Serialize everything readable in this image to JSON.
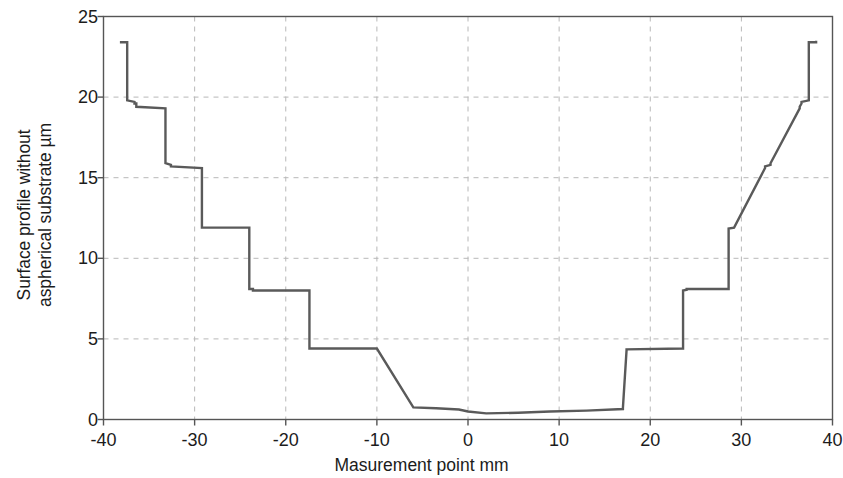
{
  "chart_data": {
    "type": "line",
    "title": "",
    "xlabel": "Masurement point mm",
    "ylabel_line1": "Surface profile without",
    "ylabel_line2": "aspherical substrate µm",
    "xlim": [
      -40,
      40
    ],
    "ylim": [
      0,
      25
    ],
    "xticks": [
      -40,
      -30,
      -20,
      -10,
      0,
      10,
      20,
      30,
      40
    ],
    "xticklabels": [
      "-40",
      "-30",
      "-20",
      "-10",
      "0",
      "10",
      "20",
      "30",
      "40"
    ],
    "yticks": [
      0,
      5,
      10,
      15,
      20,
      25
    ],
    "yticklabels": [
      "0",
      "5",
      "10",
      "15",
      "20",
      "25"
    ],
    "grid": true,
    "grid_style": "dashed",
    "grid_color": "#b8b8b8",
    "legend": null,
    "line_color": "#5a5a5a",
    "line_width": 2.4,
    "axes_color": "#555555",
    "background": "#ffffff",
    "series": [
      {
        "name": "Surface profile",
        "x": [
          -38.2,
          -38.2,
          -37.4,
          -37.4,
          -36.6,
          -36.6,
          -36.4,
          -36.4,
          -33.2,
          -33.2,
          -32.6,
          -32.6,
          -29.2,
          -29.2,
          -28.6,
          -28.6,
          -24.0,
          -24.0,
          -23.6,
          -23.6,
          -17.4,
          -17.4,
          -17.0,
          -17.0,
          -10.0,
          -6.0,
          -3.5,
          -1.0,
          0.0,
          2.0,
          5.5,
          9.0,
          13.0,
          17.0,
          17.0,
          17.4,
          17.4,
          23.6,
          23.6,
          24.0,
          24.0,
          28.6,
          28.6,
          29.2,
          29.2,
          32.6,
          32.6,
          33.2,
          33.2,
          36.4,
          36.4,
          36.6,
          36.6,
          37.4,
          37.4,
          38.2,
          38.2
        ],
        "y": [
          23.4,
          23.4,
          23.4,
          19.8,
          19.7,
          19.6,
          19.6,
          19.4,
          19.3,
          15.9,
          15.8,
          15.7,
          15.6,
          11.9,
          11.9,
          11.9,
          11.9,
          8.1,
          8.1,
          8.0,
          8.0,
          4.4,
          4.4,
          4.4,
          4.4,
          0.75,
          0.7,
          0.62,
          0.5,
          0.38,
          0.42,
          0.5,
          0.55,
          0.65,
          0.72,
          4.3,
          4.35,
          4.4,
          8.0,
          8.05,
          8.1,
          8.1,
          11.85,
          11.9,
          11.9,
          15.6,
          15.7,
          15.8,
          15.9,
          19.3,
          19.4,
          19.6,
          19.7,
          19.8,
          23.4,
          23.4,
          23.5
        ]
      }
    ],
    "plateaus": [
      {
        "zone": 1,
        "x_from": -38.2,
        "x_to": -37.4,
        "level": 23.4
      },
      {
        "zone": 2,
        "x_from": -37.2,
        "x_to": -33.4,
        "level": 19.65
      },
      {
        "zone": 3,
        "x_from": -33.0,
        "x_to": -29.2,
        "level": 15.75
      },
      {
        "zone": 4,
        "x_from": -28.8,
        "x_to": -24.0,
        "level": 11.9
      },
      {
        "zone": 5,
        "x_from": -23.6,
        "x_to": -17.4,
        "level": 8.05
      },
      {
        "zone": 6,
        "x_from": -17.0,
        "x_to": 17.0,
        "level": 0.55
      },
      {
        "zone": 7,
        "x_from": 17.4,
        "x_to": 23.6,
        "level": 4.35
      },
      {
        "zone": 8,
        "x_from": 24.0,
        "x_to": 28.6,
        "level": 8.05
      },
      {
        "zone": 9,
        "x_from": 29.2,
        "x_to": 32.6,
        "level": 11.9
      },
      {
        "zone": 10,
        "x_from": 33.2,
        "x_to": 36.4,
        "level": 15.75
      },
      {
        "zone": 11,
        "x_from": 36.6,
        "x_to": 37.4,
        "level": 19.65
      },
      {
        "zone": 12,
        "x_from": 37.6,
        "x_to": 38.4,
        "level": 23.45
      }
    ]
  }
}
